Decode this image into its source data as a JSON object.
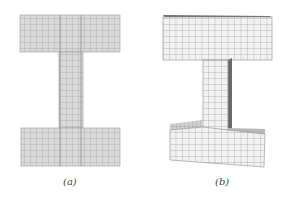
{
  "figure": {
    "panels": [
      {
        "id": "a",
        "caption": "(a)",
        "description": "flat I-shaped quadrilateral mesh (2D view)"
      },
      {
        "id": "b",
        "caption": "(b)",
        "description": "extruded I-shaped hexahedral mesh (3D view)"
      }
    ],
    "colors": {
      "mesh_fill_2d": "#d9d9d9",
      "mesh_line_2d": "#9a9a9a",
      "mesh_fill_3d": "#f2f2f2",
      "mesh_line_3d": "#8c8c8c",
      "side_face": "#7a7a7a",
      "top_face": "#c8c8c8",
      "caption": "#444444"
    }
  }
}
